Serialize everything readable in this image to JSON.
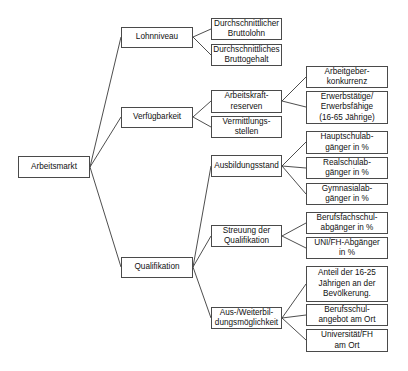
{
  "diagram": {
    "type": "tree",
    "orientation": "left-to-right",
    "root": {
      "id": "arbeitsmarkt",
      "label": "Arbeitsmarkt"
    },
    "nodes": {
      "arbeitsmarkt": "Arbeitsmarkt",
      "lohnniveau": "Lohnniveau",
      "verfuegbarkeit": "Verfügbarkeit",
      "qualifikation": "Qualifikation",
      "bruttolohn": "Durchschnittlicher\nBruttolohn",
      "bruttogehalt": "Durchschnittliches\nBruttogehalt",
      "arbeitskraftreserven": "Arbeitskraft-\nreserven",
      "vermittlungsstellen": "Vermittlungs-\nstellen",
      "arbeitgeberkonkurrenz": "Arbeitgeber-\nkonkurrenz",
      "erwerbstaetige": "Erwerbstätige/\nErwerbsfähige\n(16-65 Jährige)",
      "ausbildungsstand": "Ausbildungsstand",
      "hauptschul": "Hauptschulab-\ngänger in %",
      "realschul": "Realschulab-\ngänger in %",
      "gymnasial": "Gymnasialab-\ngänger in %",
      "streuung": "Streuung der\nQualifikation",
      "berufsfachschul": "Berufsfachschul-\nabgänger in %",
      "unifh": "UNI/FH-Abgänger\nin %",
      "ausweiterbildung": "Aus-/Weiterbil-\ndungsmöglichkeit",
      "anteil": "Anteil der 16-25\nJährigen an der\nBevölkerung.",
      "berufsschulangebot": "Berufsschul-\nangebot am Ort",
      "universitaet": "Universität/FH\nam Ort"
    },
    "edges": [
      [
        "arbeitsmarkt",
        "lohnniveau"
      ],
      [
        "arbeitsmarkt",
        "verfuegbarkeit"
      ],
      [
        "arbeitsmarkt",
        "qualifikation"
      ],
      [
        "lohnniveau",
        "bruttolohn"
      ],
      [
        "lohnniveau",
        "bruttogehalt"
      ],
      [
        "verfuegbarkeit",
        "arbeitskraftreserven"
      ],
      [
        "verfuegbarkeit",
        "vermittlungsstellen"
      ],
      [
        "arbeitskraftreserven",
        "arbeitgeberkonkurrenz"
      ],
      [
        "arbeitskraftreserven",
        "erwerbstaetige"
      ],
      [
        "qualifikation",
        "ausbildungsstand"
      ],
      [
        "qualifikation",
        "streuung"
      ],
      [
        "qualifikation",
        "ausweiterbildung"
      ],
      [
        "ausbildungsstand",
        "hauptschul"
      ],
      [
        "ausbildungsstand",
        "realschul"
      ],
      [
        "ausbildungsstand",
        "gymnasial"
      ],
      [
        "streuung",
        "berufsfachschul"
      ],
      [
        "streuung",
        "unifh"
      ],
      [
        "ausweiterbildung",
        "anteil"
      ],
      [
        "ausweiterbildung",
        "berufsschulangebot"
      ],
      [
        "ausweiterbildung",
        "universitaet"
      ]
    ]
  },
  "colors": {
    "background": "#ffffff",
    "border": "#4a4a4a",
    "line": "#3a3a3a",
    "text": "#111111"
  }
}
